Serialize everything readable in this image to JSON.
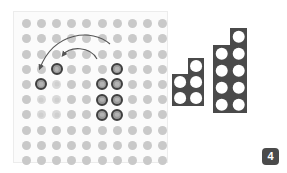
{
  "board": {
    "name": "puzzle-board",
    "rows": 10,
    "cols": 10,
    "cell_size": 15.2,
    "dot_diameter": 9,
    "colors": {
      "panel_background": "#fbfbfb",
      "panel_border": "#ececec",
      "empty_dot": "#c9c9c9",
      "ghost_dot": "#d9d9d9",
      "filled_fill": "#9a9a9a",
      "filled_outline": "#3f3f3f",
      "filled_inner": "#b3b3b3"
    },
    "filled_cells": [
      {
        "r": 3,
        "c": 2
      },
      {
        "r": 4,
        "c": 1
      },
      {
        "r": 3,
        "c": 6
      },
      {
        "r": 4,
        "c": 5
      },
      {
        "r": 4,
        "c": 6
      },
      {
        "r": 5,
        "c": 5
      },
      {
        "r": 5,
        "c": 6
      },
      {
        "r": 6,
        "c": 5
      },
      {
        "r": 6,
        "c": 6
      }
    ],
    "ghost_cells": [
      {
        "r": 5,
        "c": 1
      },
      {
        "r": 5,
        "c": 2
      },
      {
        "r": 6,
        "c": 1
      },
      {
        "r": 6,
        "c": 2
      },
      {
        "r": 4,
        "c": 2
      }
    ]
  },
  "arrows": [
    {
      "name": "arrow-long-left",
      "start_x": 96,
      "start_y": 32,
      "end_x": 26,
      "end_y": 62,
      "color": "#555555"
    },
    {
      "name": "arrow-short-left",
      "start_x": 83,
      "start_y": 47,
      "end_x": 48,
      "end_y": 48,
      "color": "#555555"
    }
  ],
  "tray": {
    "name": "piece-tray",
    "cell_color": "#4a4a4a",
    "dot_color": "#ffffff",
    "shapes": [
      {
        "name": "tray-shape-p-piece",
        "label": "P piece",
        "cell_px": 16,
        "left": 0,
        "top": 47,
        "cells": [
          {
            "r": 0,
            "c": 1
          },
          {
            "r": 1,
            "c": 0
          },
          {
            "r": 1,
            "c": 1
          },
          {
            "r": 2,
            "c": 0
          },
          {
            "r": 2,
            "c": 1
          }
        ]
      },
      {
        "name": "tray-shape-tall-piece",
        "label": "Tall piece",
        "cell_px": 17,
        "left": 41,
        "top": 17,
        "cells": [
          {
            "r": 0,
            "c": 1
          },
          {
            "r": 1,
            "c": 0
          },
          {
            "r": 1,
            "c": 1
          },
          {
            "r": 2,
            "c": 0
          },
          {
            "r": 2,
            "c": 1
          },
          {
            "r": 3,
            "c": 0
          },
          {
            "r": 3,
            "c": 1
          },
          {
            "r": 4,
            "c": 0
          },
          {
            "r": 4,
            "c": 1
          }
        ]
      }
    ]
  },
  "badge": {
    "name": "step-number-badge",
    "text": "4",
    "background": "#4a4a4a",
    "color": "#ffffff"
  }
}
